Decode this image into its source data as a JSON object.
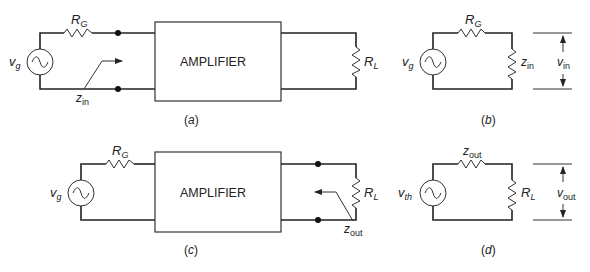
{
  "figure": {
    "panels": [
      {
        "id": "a",
        "caption": "(a)",
        "source_label": "v",
        "source_sub": "g",
        "resistor_label": "R",
        "resistor_sub": "G",
        "block_label": "AMPLIFIER",
        "load_label": "R",
        "load_sub": "L",
        "impedance_label": "z",
        "impedance_sub": "in"
      },
      {
        "id": "b",
        "caption": "(b)",
        "source_label": "v",
        "source_sub": "g",
        "resistor_label": "R",
        "resistor_sub": "G",
        "load_label": "z",
        "load_sub": "in",
        "voltage_label": "v",
        "voltage_sub": "in"
      },
      {
        "id": "c",
        "caption": "(c)",
        "source_label": "v",
        "source_sub": "g",
        "resistor_label": "R",
        "resistor_sub": "G",
        "block_label": "AMPLIFIER",
        "load_label": "R",
        "load_sub": "L",
        "impedance_label": "z",
        "impedance_sub": "out"
      },
      {
        "id": "d",
        "caption": "(d)",
        "source_label": "v",
        "source_sub": "th",
        "resistor_label": "z",
        "resistor_sub": "out",
        "load_label": "R",
        "load_sub": "L",
        "voltage_label": "v",
        "voltage_sub": "out"
      }
    ]
  }
}
